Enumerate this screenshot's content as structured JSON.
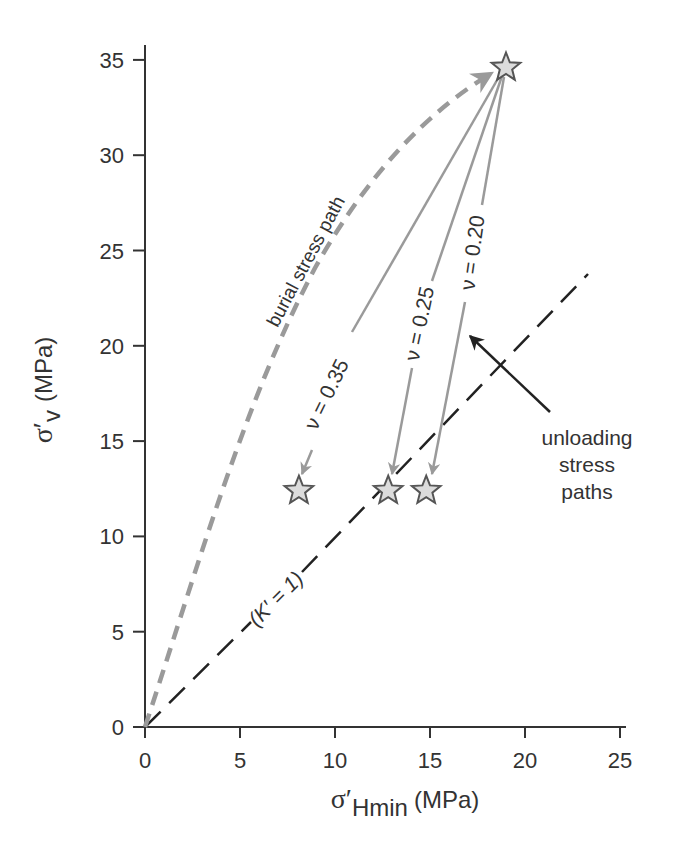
{
  "chart_data": {
    "type": "line",
    "title": "",
    "xlabel": "σ′Hmin (MPa)",
    "ylabel": "σ′v (MPa)",
    "xlabel_parts": {
      "symbol": "σ′",
      "subscript": "Hmin",
      "unit": "(MPa)"
    },
    "ylabel_parts": {
      "symbol": "σ′",
      "subscript": "v",
      "unit": "(MPa)"
    },
    "xlim": [
      0,
      27.5
    ],
    "ylim": [
      0,
      35
    ],
    "x_ticks": [
      0,
      5,
      10,
      15,
      20,
      25
    ],
    "y_ticks": [
      0,
      5,
      10,
      15,
      20,
      25,
      30,
      35
    ],
    "x_tick_labels": [
      "0",
      "5",
      "10",
      "15",
      "20",
      "25"
    ],
    "y_tick_labels": [
      "0",
      "5",
      "10",
      "15",
      "20",
      "25",
      "30",
      "35"
    ],
    "grid": false,
    "legend": null,
    "series": [
      {
        "name": "burial stress path",
        "style": "dashed-thick-gray",
        "color": "#9a9a9a",
        "points": [
          [
            0,
            0
          ],
          [
            3,
            8
          ],
          [
            6,
            15
          ],
          [
            9.5,
            22
          ],
          [
            13,
            27.5
          ],
          [
            16.5,
            31.8
          ],
          [
            19.0,
            34.6
          ]
        ],
        "arrow_at_end": true
      },
      {
        "name": "ν = 0.35",
        "style": "solid-gray",
        "color": "#9a9a9a",
        "points": [
          [
            19.0,
            34.6
          ],
          [
            8.1,
            12.4
          ]
        ],
        "arrow_at_end": true
      },
      {
        "name": "ν = 0.25",
        "style": "solid-gray",
        "color": "#9a9a9a",
        "points": [
          [
            19.0,
            34.6
          ],
          [
            12.8,
            12.4
          ]
        ],
        "arrow_at_end": true
      },
      {
        "name": "ν = 0.20",
        "style": "solid-gray",
        "color": "#9a9a9a",
        "points": [
          [
            19.0,
            34.6
          ],
          [
            14.8,
            12.4
          ]
        ],
        "arrow_at_end": true
      },
      {
        "name": "(K′ = 1)",
        "style": "dashed-black",
        "color": "#222222",
        "points": [
          [
            0,
            0
          ],
          [
            23.5,
            23.8
          ]
        ],
        "arrow_at_end": false
      }
    ],
    "markers": [
      {
        "shape": "star",
        "x": 19.0,
        "y": 34.6,
        "label": "peak burial state"
      },
      {
        "shape": "star",
        "x": 8.1,
        "y": 12.4,
        "label": "ν = 0.35 end"
      },
      {
        "shape": "star",
        "x": 12.8,
        "y": 12.4,
        "label": "ν = 0.25 end"
      },
      {
        "shape": "star",
        "x": 14.8,
        "y": 12.4,
        "label": "ν = 0.20 end"
      }
    ],
    "annotations": [
      {
        "text": "burial stress path",
        "x": 8.2,
        "y": 24.5,
        "rotation": -62
      },
      {
        "text": "ν = 0.35",
        "x": 9.4,
        "y": 16.5,
        "rotation": -64
      },
      {
        "text": "ν = 0.25",
        "x": 13.6,
        "y": 21.5,
        "rotation": -78
      },
      {
        "text": "ν = 0.20",
        "x": 16.7,
        "y": 26.4,
        "rotation": -82
      },
      {
        "text": "(K′ = 1)",
        "x": 6.8,
        "y": 6.7,
        "rotation": -45
      },
      {
        "text": "unloading stress paths",
        "x": 23.2,
        "y": 13.8,
        "rotation": 0,
        "arrow_to": [
          17.0,
          20.7
        ]
      }
    ]
  },
  "labels": {
    "x_symbol": "σ′",
    "x_sub": "Hmin",
    "x_unit": "(MPa)",
    "y_symbol": "σ′",
    "y_sub": "v",
    "y_unit": "(MPa)",
    "burial": "burial stress path",
    "nu35": "ν = 0.35",
    "nu25": "ν = 0.25",
    "nu20": "ν = 0.20",
    "k1": "(K′ = 1)",
    "unload_1": "unloading",
    "unload_2": "stress",
    "unload_3": "paths"
  },
  "colors": {
    "axis": "#333333",
    "gray_path": "#9a9a9a",
    "black_dash": "#222222",
    "star_fill": "#dcdcdc",
    "star_stroke": "#555555"
  }
}
